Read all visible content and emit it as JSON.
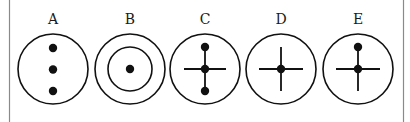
{
  "figure": {
    "frame": {
      "left_x": 9.5,
      "right_x": 403.5,
      "color": "#8a8a8a"
    },
    "stroke_color": "#111111",
    "diagrams": [
      {
        "label": "A",
        "cx": 53,
        "cy": 69,
        "r": 35,
        "description": "circle with three dots in a vertical column",
        "dots": [
          [
            53,
            48
          ],
          [
            53,
            69.5
          ],
          [
            53,
            91
          ]
        ],
        "inner_circle_r": null,
        "lines": []
      },
      {
        "label": "B",
        "cx": 130,
        "cy": 69,
        "r": 35,
        "description": "concentric circles with a center dot",
        "dots": [
          [
            130,
            69
          ]
        ],
        "inner_circle_r": 22,
        "lines": []
      },
      {
        "label": "C",
        "cx": 205,
        "cy": 69,
        "r": 35,
        "description": "circle with vertical line of three dots and horizontal crossbar",
        "dots": [
          [
            205,
            47
          ],
          [
            205,
            69
          ],
          [
            205,
            91
          ]
        ],
        "inner_circle_r": null,
        "lines": [
          [
            205,
            47,
            205,
            91
          ],
          [
            184,
            69,
            226,
            69
          ]
        ]
      },
      {
        "label": "D",
        "cx": 281,
        "cy": 69,
        "r": 35,
        "description": "circle with a cross and center dot",
        "dots": [
          [
            281,
            69
          ]
        ],
        "inner_circle_r": null,
        "lines": [
          [
            281,
            47,
            281,
            91
          ],
          [
            259,
            69,
            303,
            69
          ]
        ]
      },
      {
        "label": "E",
        "cx": 358,
        "cy": 69,
        "r": 35,
        "description": "circle with a cross, center dot and top dot",
        "dots": [
          [
            358,
            47
          ],
          [
            358,
            69
          ]
        ],
        "inner_circle_r": null,
        "lines": [
          [
            358,
            47,
            358,
            91
          ],
          [
            336,
            69,
            380,
            69
          ]
        ]
      }
    ]
  }
}
